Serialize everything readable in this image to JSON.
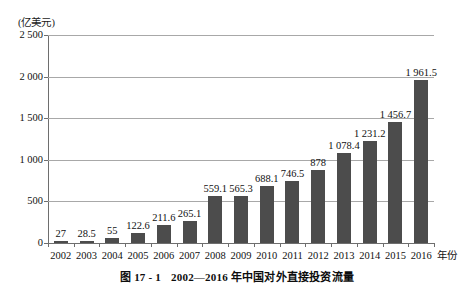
{
  "figure": {
    "caption_number": "图 17 - 1",
    "caption_text": "2002—2016 年中国对外直接投资流量",
    "unit_label": "(亿美元)",
    "xaxis_title": "年份"
  },
  "chart_data": {
    "type": "bar",
    "title": "2002—2016 年中国对外直接投资流量",
    "xlabel": "年份",
    "ylabel": "(亿美元)",
    "ylim": [
      0,
      2500
    ],
    "yticks": [
      0,
      500,
      1000,
      1500,
      2000,
      2500
    ],
    "ytick_labels": [
      "0",
      "500",
      "1 000",
      "1 500",
      "2 000",
      "2 500"
    ],
    "grid": true,
    "legend": "none",
    "bar_color": "#4c4c4c",
    "categories": [
      "2002",
      "2003",
      "2004",
      "2005",
      "2006",
      "2007",
      "2008",
      "2009",
      "2010",
      "2011",
      "2012",
      "2013",
      "2014",
      "2015",
      "2016"
    ],
    "values": [
      27,
      28.5,
      55,
      122.6,
      211.6,
      265.1,
      559.1,
      565.3,
      688.1,
      746.5,
      878,
      1078.4,
      1231.2,
      1456.7,
      1961.5
    ],
    "value_labels": [
      "27",
      "28.5",
      "55",
      "122.6",
      "211.6",
      "265.1",
      "559.1",
      "565.3",
      "688.1",
      "746.5",
      "878",
      "1 078.4",
      "1 231.2",
      "1 456.7",
      "1 961.5"
    ]
  }
}
